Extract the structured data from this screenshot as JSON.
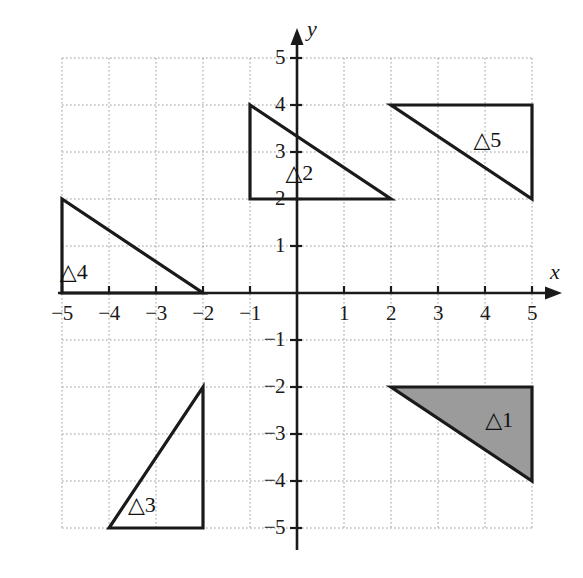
{
  "figure": {
    "type": "coordinate-plane-diagram",
    "background_color": "#ffffff",
    "grid": {
      "visible": true,
      "style": "dotted",
      "color": "#9a9a9a",
      "x_min": -5,
      "x_max": 5,
      "y_min": -5,
      "y_max": 5,
      "step": 1
    },
    "axes": {
      "x_label": "x",
      "y_label": "y",
      "color": "#1a1a1a",
      "arrow_x": true,
      "arrow_y": true,
      "x_ticks": [
        -5,
        -4,
        -3,
        -2,
        -1,
        1,
        2,
        3,
        4,
        5
      ],
      "y_ticks": [
        5,
        4,
        3,
        2,
        1,
        -1,
        -2,
        -3,
        -4,
        -5
      ],
      "x_tick_labels": [
        "−5",
        "−4",
        "−3",
        "−2",
        "−1",
        "1",
        "2",
        "3",
        "4",
        "5"
      ],
      "y_tick_labels": [
        "5",
        "4",
        "3",
        "2",
        "1",
        "−1",
        "−2",
        "−3",
        "−4",
        "−5"
      ]
    }
  },
  "chart_data": {
    "type": "scatter",
    "title": "",
    "xlabel": "x",
    "ylabel": "y",
    "xlim": [
      -5,
      5
    ],
    "ylim": [
      -5,
      5
    ],
    "grid": true,
    "legend": "none",
    "shapes": [
      {
        "name": "triangle-1",
        "label": "△1",
        "vertices": [
          [
            2,
            -2
          ],
          [
            5,
            -2
          ],
          [
            5,
            -4
          ]
        ],
        "filled": true,
        "fill_color": "#9b9b9b",
        "stroke_color": "#1a1a1a",
        "label_position": [
          4.3,
          -2.7
        ]
      },
      {
        "name": "triangle-2",
        "label": "△2",
        "vertices": [
          [
            -1,
            4
          ],
          [
            -1,
            2
          ],
          [
            2,
            2
          ]
        ],
        "filled": false,
        "fill_color": "none",
        "stroke_color": "#1a1a1a",
        "label_position": [
          0.05,
          2.55
        ]
      },
      {
        "name": "triangle-3",
        "label": "△3",
        "vertices": [
          [
            -4,
            -5
          ],
          [
            -2,
            -5
          ],
          [
            -2,
            -2
          ]
        ],
        "filled": false,
        "fill_color": "none",
        "stroke_color": "#1a1a1a",
        "label_position": [
          -3.3,
          -4.5
        ]
      },
      {
        "name": "triangle-4",
        "label": "△4",
        "vertices": [
          [
            -5,
            2
          ],
          [
            -5,
            0
          ],
          [
            -2,
            0
          ]
        ],
        "filled": false,
        "fill_color": "none",
        "stroke_color": "#1a1a1a",
        "label_position": [
          -4.75,
          0.45
        ]
      },
      {
        "name": "triangle-5",
        "label": "△5",
        "vertices": [
          [
            2,
            4
          ],
          [
            5,
            4
          ],
          [
            5,
            2
          ]
        ],
        "filled": false,
        "fill_color": "none",
        "stroke_color": "#1a1a1a",
        "label_position": [
          4.05,
          3.25
        ]
      }
    ]
  }
}
